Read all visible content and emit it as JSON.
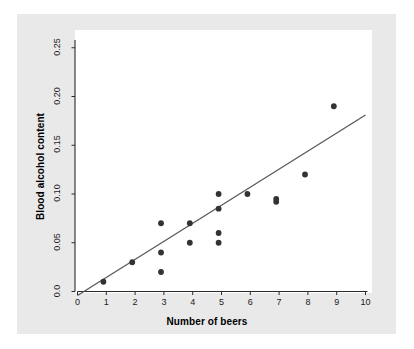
{
  "chart_data": {
    "type": "scatter",
    "title": "",
    "xlabel": "Number of beers",
    "ylabel": "Blood alcohol content",
    "xlim": [
      0,
      10
    ],
    "ylim": [
      0.0,
      0.26
    ],
    "grid": false,
    "legend": null,
    "xticks": [
      "0",
      "1",
      "2",
      "3",
      "4",
      "5",
      "6",
      "7",
      "8",
      "9",
      "10"
    ],
    "xtick_values": [
      0,
      1,
      2,
      3,
      4,
      5,
      6,
      7,
      8,
      9,
      10
    ],
    "yticks": [
      "0.0",
      "0.05",
      "0.10",
      "0.15",
      "0.20",
      "0.25"
    ],
    "ytick_values": [
      0.0,
      0.05,
      0.1,
      0.15,
      0.2,
      0.25
    ],
    "point_color": "#333333",
    "line_color": "#555555",
    "plot_background": "#ffffff",
    "figure_background": "#e9e9e9",
    "series": [
      {
        "name": "observations",
        "x": [
          0.9,
          1.9,
          2.9,
          2.9,
          2.9,
          3.9,
          3.9,
          4.9,
          4.9,
          4.9,
          4.9,
          5.9,
          6.9,
          6.9,
          7.9,
          8.9
        ],
        "y": [
          0.01,
          0.03,
          0.07,
          0.04,
          0.02,
          0.07,
          0.05,
          0.1,
          0.085,
          0.06,
          0.05,
          0.1,
          0.095,
          0.092,
          0.12,
          0.19
        ]
      }
    ],
    "regression_line": {
      "name": "least-squares fit",
      "x_start": 0.0,
      "y_start": -0.004,
      "x_end": 10.0,
      "y_end": 0.181
    }
  }
}
